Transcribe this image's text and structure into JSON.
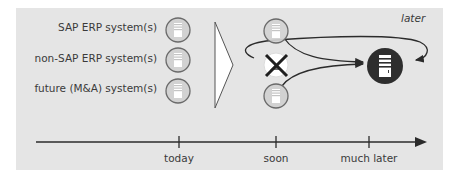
{
  "diagram": {
    "systems": [
      {
        "label": "SAP ERP system(s)"
      },
      {
        "label": "non-SAP ERP system(s)"
      },
      {
        "label": "future (M&A) system(s)"
      }
    ],
    "annotation": "later",
    "timeline": {
      "ticks": [
        {
          "label": "today"
        },
        {
          "label": "soon"
        },
        {
          "label": "much later"
        }
      ]
    },
    "colors": {
      "panel": "#e5e5e5",
      "server_circle": "#d3d3d3",
      "target_circle": "#2e2e2e",
      "line": "#2b2b2b"
    },
    "icons": {
      "source_server": "server-icon",
      "target_server": "server-icon",
      "removed_system": "cross-icon",
      "transition": "chevron-right-icon"
    }
  }
}
